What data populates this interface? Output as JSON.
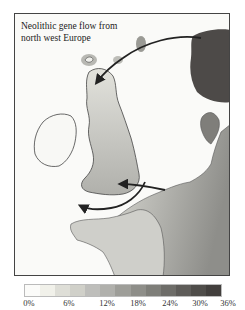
{
  "map": {
    "title": "Neolithic gene flow from\nnorth west Europe",
    "regions": [
      "Scandinavia",
      "Ireland",
      "Great Britain",
      "Orkney",
      "Shetland",
      "France",
      "Low Countries",
      "Denmark",
      "Brittany"
    ],
    "arrows": [
      {
        "from": "Scandinavia",
        "to": "Northern Scotland"
      },
      {
        "from": "Low Countries",
        "to": "Southern England"
      },
      {
        "from": "Southern England",
        "to": "Brittany"
      }
    ]
  },
  "legend": {
    "colors": [
      "#fbfbf9",
      "#f1f1ea",
      "#deded7",
      "#d0d0c9",
      "#bebebb",
      "#b0b0ac",
      "#9e9e99",
      "#8e8e89",
      "#7e7e79",
      "#6e6d69",
      "#5e5c59",
      "#4f4d4a",
      "#423f3d"
    ],
    "labels": [
      {
        "text": "0%",
        "x": 13
      },
      {
        "text": "6%",
        "x": 53
      },
      {
        "text": "12%",
        "x": 91
      },
      {
        "text": "18%",
        "x": 122
      },
      {
        "text": "24%",
        "x": 154
      },
      {
        "text": "30%",
        "x": 184
      },
      {
        "text": "36%",
        "x": 212
      }
    ]
  }
}
